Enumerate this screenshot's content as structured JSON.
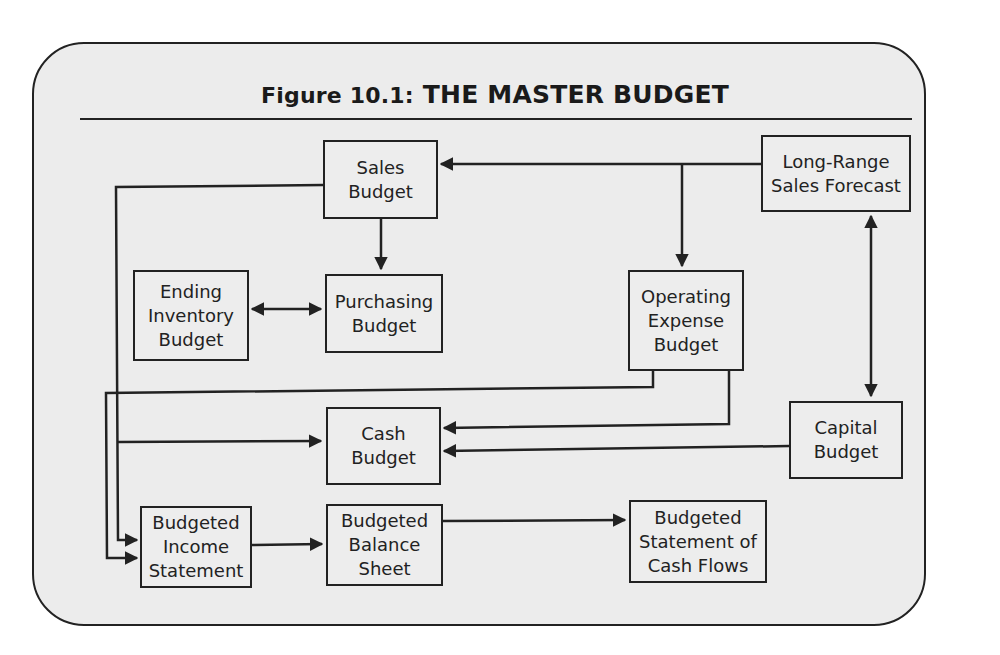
{
  "figure": {
    "label": "Figure 10.1:",
    "title": "THE MASTER BUDGET"
  },
  "nodes": {
    "sales_budget": "Sales\nBudget",
    "long_range_forecast": "Long-Range\nSales Forecast",
    "ending_inventory_budget": "Ending\nInventory\nBudget",
    "purchasing_budget": "Purchasing\nBudget",
    "operating_expense_budget": "Operating\nExpense\nBudget",
    "cash_budget": "Cash\nBudget",
    "capital_budget": "Capital\nBudget",
    "budgeted_income_statement": "Budgeted\nIncome\nStatement",
    "budgeted_balance_sheet": "Budgeted\nBalance\nSheet",
    "budgeted_cash_flows": "Budgeted\nStatement of\nCash Flows"
  },
  "edges": [
    {
      "from": "Long-Range Sales Forecast",
      "to": "Sales Budget"
    },
    {
      "from": "Long-Range Sales Forecast",
      "to": "Operating Expense Budget"
    },
    {
      "from": "Long-Range Sales Forecast",
      "to": "Capital Budget",
      "bidirectional": true
    },
    {
      "from": "Sales Budget",
      "to": "Purchasing Budget"
    },
    {
      "from": "Ending Inventory Budget",
      "to": "Purchasing Budget",
      "bidirectional": true
    },
    {
      "from": "Sales Budget",
      "to": "Cash Budget"
    },
    {
      "from": "Sales Budget",
      "to": "Budgeted Income Statement"
    },
    {
      "from": "Operating Expense Budget",
      "to": "Cash Budget"
    },
    {
      "from": "Operating Expense Budget",
      "to": "Budgeted Income Statement"
    },
    {
      "from": "Capital Budget",
      "to": "Cash Budget"
    },
    {
      "from": "Budgeted Income Statement",
      "to": "Budgeted Balance Sheet"
    },
    {
      "from": "Budgeted Balance Sheet",
      "to": "Budgeted Statement of Cash Flows"
    }
  ],
  "colors": {
    "background": "#ececec",
    "stroke": "#222222"
  }
}
